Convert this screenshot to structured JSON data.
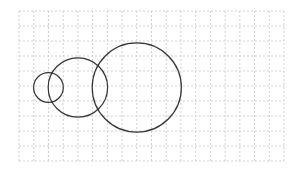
{
  "diagram": {
    "title": "",
    "grid": {
      "columns": 18,
      "rows": 10,
      "line_style": "dashed",
      "line_color": "#cfcfcf"
    },
    "stroke_color": "#333333",
    "background": "#ffffff",
    "shapes": [
      {
        "id": "circle-small",
        "type": "circle",
        "center_grid": [
          2,
          5.1
        ],
        "radius_grid": 1.0
      },
      {
        "id": "circle-medium",
        "type": "circle",
        "center_grid": [
          4,
          5.1
        ],
        "radius_grid": 2.0
      },
      {
        "id": "circle-large",
        "type": "circle",
        "center_grid": [
          8,
          5.1
        ],
        "radius_grid": 3.0
      }
    ]
  }
}
